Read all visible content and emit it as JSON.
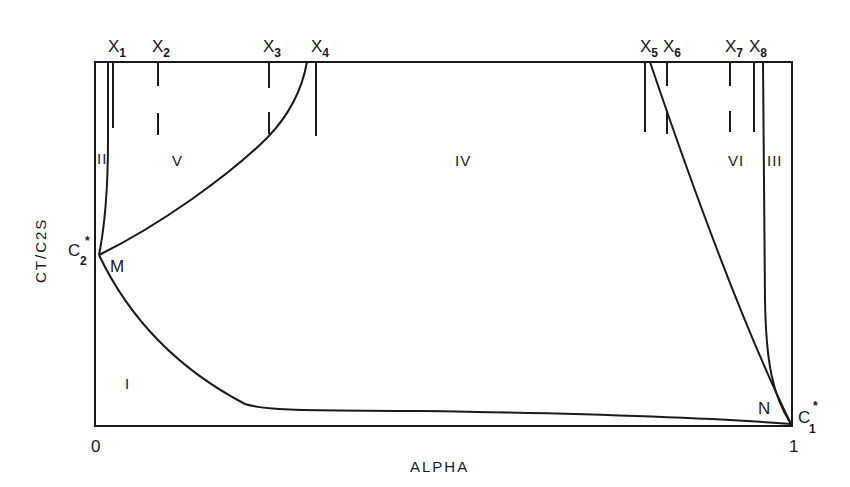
{
  "figure": {
    "xlabel": "ALPHA",
    "ylabel": "CT/C2S",
    "x_ticks": [
      "0",
      "1"
    ],
    "points": {
      "c2_star": {
        "base": "C",
        "sub": "2",
        "sup": "*"
      },
      "c1_star": {
        "base": "C",
        "sub": "1",
        "sup": "*"
      },
      "m": "M",
      "n": "N"
    },
    "markers": [
      {
        "base": "X",
        "sub": "1",
        "style": "solid"
      },
      {
        "base": "X",
        "sub": "2",
        "style": "dashed"
      },
      {
        "base": "X",
        "sub": "3",
        "style": "dashed"
      },
      {
        "base": "X",
        "sub": "4",
        "style": "solid"
      },
      {
        "base": "X",
        "sub": "5",
        "style": "solid"
      },
      {
        "base": "X",
        "sub": "6",
        "style": "dashed"
      },
      {
        "base": "X",
        "sub": "7",
        "style": "dashed"
      },
      {
        "base": "X",
        "sub": "8",
        "style": "solid"
      }
    ],
    "regions": {
      "r1": "I",
      "r2": "II",
      "r3": "III",
      "r4": "IV",
      "r5": "V",
      "r6": "VI"
    },
    "line_color": "#1a1a1a"
  }
}
